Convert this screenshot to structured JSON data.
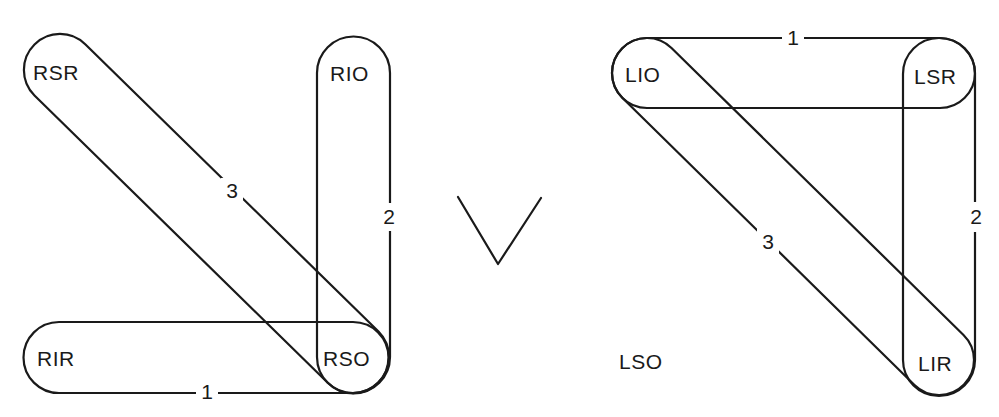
{
  "diagram": {
    "type": "extraocular-muscle-pairing",
    "symbol": "V",
    "colors": {
      "line": "#1a1a1a",
      "background": "#ffffff"
    },
    "right_eye": {
      "muscles": [
        {
          "id": "RSR",
          "label": "RSR"
        },
        {
          "id": "RIO",
          "label": "RIO"
        },
        {
          "id": "RIR",
          "label": "RIR"
        },
        {
          "id": "RSO",
          "label": "RSO"
        }
      ],
      "pairs": [
        {
          "number": "1",
          "from": "RIR",
          "to": "RSO"
        },
        {
          "number": "2",
          "from": "RIO",
          "to": "RSO"
        },
        {
          "number": "3",
          "from": "RSR",
          "to": "RSO"
        }
      ]
    },
    "left_eye": {
      "muscles": [
        {
          "id": "LIO",
          "label": "LIO"
        },
        {
          "id": "LSR",
          "label": "LSR"
        },
        {
          "id": "LSO",
          "label": "LSO"
        },
        {
          "id": "LIR",
          "label": "LIR"
        }
      ],
      "pairs": [
        {
          "number": "1",
          "from": "LIO",
          "to": "LSR"
        },
        {
          "number": "2",
          "from": "LSR",
          "to": "LIR"
        },
        {
          "number": "3",
          "from": "LIO",
          "to": "LIR"
        }
      ]
    }
  }
}
